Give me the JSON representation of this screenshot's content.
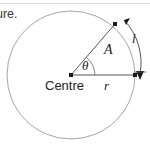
{
  "page": {
    "background_color": "#ffffff",
    "width": 150,
    "height": 148
  },
  "header": {
    "clipped_text": "ure.",
    "rule_color": "#dcdcdc"
  },
  "diagram": {
    "type": "circle-sector-geometry",
    "stroke_color": "#8a8a8a",
    "line_color": "#555555",
    "point_color": "#1a1a1a",
    "circle": {
      "center_x": 71,
      "center_y": 75,
      "radius": 64
    },
    "labels": {
      "centre": "Centre",
      "theta": "θ",
      "radius": "r",
      "area": "A",
      "arc_length": "l"
    },
    "points": [
      {
        "name": "centre-point",
        "x": 71,
        "y": 75
      },
      {
        "name": "sector-upper-point",
        "x": 115,
        "y": 24
      },
      {
        "name": "sector-right-point",
        "x": 135,
        "y": 75
      }
    ],
    "arc_measure": {
      "label": "l",
      "arrow_style": "double-headed",
      "start_x": 122,
      "start_y": 17,
      "end_x": 141,
      "end_y": 78
    }
  }
}
